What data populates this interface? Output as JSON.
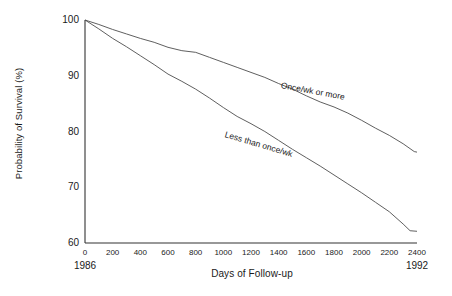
{
  "chart_data": {
    "type": "line",
    "title": "",
    "subtitle": "",
    "xlabel": "Days of Follow-up",
    "ylabel": "Probability of Survival (%)",
    "xlim": [
      0,
      2400
    ],
    "ylim": [
      60,
      100
    ],
    "grid": false,
    "legend_position": "inline-curve-labels",
    "x_ticks": [
      0,
      200,
      400,
      600,
      800,
      1000,
      1200,
      1400,
      1600,
      1800,
      2000,
      2200,
      2400
    ],
    "x_tick_labels": [
      "0",
      "200",
      "400",
      "600",
      "800",
      "1000",
      "1200",
      "1400",
      "1600",
      "1800",
      "2000",
      "2200",
      "2400"
    ],
    "x_secondary_ticks": [
      {
        "value": 0,
        "label": "1986"
      },
      {
        "value": 2400,
        "label": "1992"
      }
    ],
    "y_ticks": [
      60,
      70,
      80,
      90,
      100
    ],
    "y_tick_labels": [
      "60",
      "70",
      "80",
      "90",
      "100"
    ],
    "line_color": "#4d4d4d",
    "axis_color": "#333333",
    "background_color": "#ffffff",
    "series": [
      {
        "name": "Once/wk or more",
        "label_x": 1420,
        "label_y": 88.4,
        "label_angle": 10.5,
        "x": [
          0,
          100,
          200,
          300,
          400,
          500,
          600,
          700,
          800,
          900,
          1000,
          1100,
          1200,
          1300,
          1400,
          1500,
          1600,
          1700,
          1800,
          1900,
          2000,
          2100,
          2200,
          2300,
          2380,
          2400
        ],
        "values": [
          100,
          99.2,
          98.3,
          97.5,
          96.7,
          96.0,
          95.1,
          94.5,
          94.2,
          93.3,
          92.4,
          91.5,
          90.6,
          89.7,
          88.6,
          87.6,
          86.4,
          85.3,
          84.4,
          83.3,
          82.0,
          80.6,
          79.3,
          77.8,
          76.4,
          76.3
        ]
      },
      {
        "name": "Less than once/wk",
        "label_x": 1010,
        "label_y": 79.6,
        "label_angle": 16.5,
        "x": [
          0,
          100,
          200,
          300,
          400,
          500,
          600,
          700,
          800,
          900,
          1000,
          1100,
          1200,
          1300,
          1400,
          1500,
          1600,
          1700,
          1800,
          1900,
          2000,
          2100,
          2200,
          2300,
          2350,
          2400
        ],
        "values": [
          100,
          98.4,
          96.7,
          95.2,
          93.6,
          92.0,
          90.3,
          89.0,
          87.6,
          86.0,
          84.3,
          82.7,
          81.4,
          80.0,
          78.4,
          76.8,
          75.3,
          73.8,
          72.2,
          70.6,
          69.0,
          67.3,
          65.6,
          63.4,
          62.2,
          62.1
        ]
      }
    ]
  }
}
